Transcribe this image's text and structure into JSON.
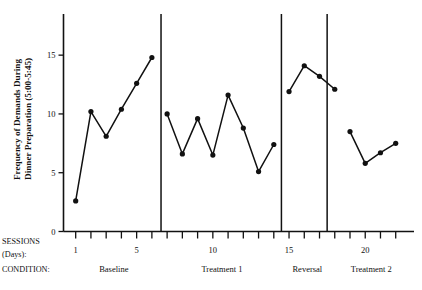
{
  "chart_data": {
    "type": "line",
    "title": "",
    "subtitle": "",
    "xlabel": "SESSIONS (Days):",
    "ylabel": "Frequency of Demands During Dinner Preparation (5:00-5:45)",
    "xlim": [
      0.2,
      23.2
    ],
    "ylim": [
      0,
      18.5
    ],
    "yticks": [
      0,
      5,
      10,
      15
    ],
    "ytick_labels": [
      "0",
      "5",
      "10",
      "15"
    ],
    "xticks": [
      1,
      2,
      3,
      4,
      5,
      6,
      7,
      8,
      9,
      10,
      11,
      12,
      13,
      14,
      15,
      16,
      17,
      18,
      19,
      20,
      21,
      22
    ],
    "xtick_labeled": [
      1,
      5,
      10,
      15,
      20
    ],
    "xtick_labels": [
      "1",
      "5",
      "10",
      "15",
      "20"
    ],
    "grid": false,
    "legend": false,
    "legend_position": "none",
    "marker": "filled-circle",
    "line_color": "#111111",
    "marker_color": "#111111",
    "design": "ABAB reversal",
    "phases": [
      {
        "name": "Baseline",
        "x_start": 0.4,
        "x_end": 6.6,
        "label_x": 3.5,
        "points": [
          {
            "x": 1,
            "y": 2.6
          },
          {
            "x": 2,
            "y": 10.2
          },
          {
            "x": 3,
            "y": 8.1
          },
          {
            "x": 4,
            "y": 10.4
          },
          {
            "x": 5,
            "y": 12.6
          },
          {
            "x": 6,
            "y": 14.8
          }
        ]
      },
      {
        "name": "Treatment 1",
        "x_start": 6.6,
        "x_end": 14.5,
        "label_x": 10.6,
        "points": [
          {
            "x": 7,
            "y": 10.0
          },
          {
            "x": 8,
            "y": 6.6
          },
          {
            "x": 9,
            "y": 9.6
          },
          {
            "x": 10,
            "y": 6.5
          },
          {
            "x": 11,
            "y": 11.6
          },
          {
            "x": 12,
            "y": 8.8
          },
          {
            "x": 13,
            "y": 5.1
          },
          {
            "x": 14,
            "y": 7.4
          }
        ]
      },
      {
        "name": "Reversal",
        "x_start": 14.5,
        "x_end": 17.5,
        "label_x": 16.2,
        "points": [
          {
            "x": 15,
            "y": 11.9
          },
          {
            "x": 16,
            "y": 14.1
          },
          {
            "x": 17,
            "y": 13.2
          },
          {
            "x": 18,
            "y": 12.1
          }
        ]
      },
      {
        "name": "Treatment 2",
        "x_start": 17.5,
        "x_end": 22.8,
        "label_x": 20.4,
        "points": [
          {
            "x": 19,
            "y": 8.5
          },
          {
            "x": 20,
            "y": 5.8
          },
          {
            "x": 21,
            "y": 6.7
          },
          {
            "x": 22,
            "y": 7.5
          }
        ]
      }
    ],
    "phase_separators": [
      6.6,
      14.5,
      17.5
    ]
  },
  "axis": {
    "y_label_line1": "Frequency of Demands During",
    "y_label_line2": "Dinner Preparation (5:00-5:45)"
  },
  "rows": {
    "sessions_label_line1": "SESSIONS",
    "sessions_label_line2": "(Days):",
    "condition_label": "CONDITION:"
  }
}
